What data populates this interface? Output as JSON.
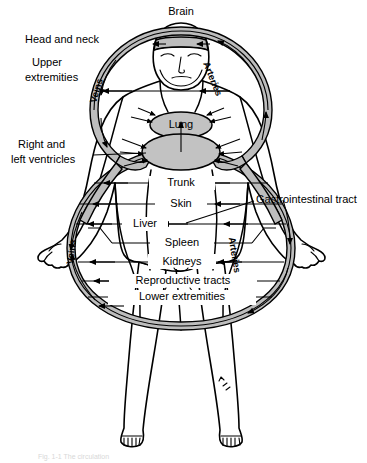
{
  "figure": {
    "caption_partial": "Fig. 1-1  The circulation",
    "background_color": "#ffffff",
    "vessel_fill_color": "#bdbdbd",
    "organ_fill_color": "#c2c2c2",
    "line_color": "#000000"
  },
  "vessel_labels": {
    "veins_upper": "Veins",
    "veins_lower": "Veins",
    "arteries_upper": "Arteries",
    "arteries_lower": "Arteries"
  },
  "callouts": {
    "brain": "Brain",
    "head_and_neck": "Head and neck",
    "upper_extremities_line1": "Upper",
    "upper_extremities_line2": "extremities",
    "ventricles_line1": "Right and",
    "ventricles_line2": "left ventricles",
    "gastrointestinal": "Gastrointestinal tract"
  },
  "organs": {
    "lung": "Lung",
    "heart": ""
  },
  "vascular_beds": [
    {
      "id": "trunk",
      "label": "Trunk",
      "y": 183
    },
    {
      "id": "skin",
      "label": "Skin",
      "y": 204
    },
    {
      "id": "liver",
      "label": "Liver",
      "y": 224
    },
    {
      "id": "spleen",
      "label": "Spleen",
      "y": 243
    },
    {
      "id": "kidneys",
      "label": "Kidneys",
      "y": 262
    },
    {
      "id": "reproductive",
      "label": "Reproductive tracts",
      "y": 281
    },
    {
      "id": "lower-extremities",
      "label": "Lower extremities",
      "y": 297
    }
  ],
  "upper_beds": [
    {
      "id": "head-neck",
      "label": "Head and neck"
    },
    {
      "id": "upper-extremities",
      "label": "Upper extremities"
    }
  ]
}
